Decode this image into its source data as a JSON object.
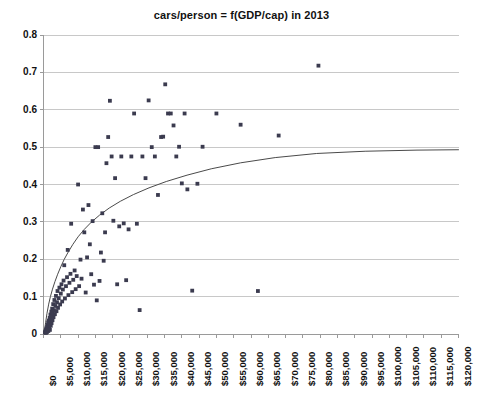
{
  "chart_data": {
    "type": "scatter",
    "title": "cars/person = f(GDP/cap) in 2013",
    "xlabel": "",
    "ylabel": "",
    "xlim": [
      0,
      120000
    ],
    "ylim": [
      0,
      0.8
    ],
    "grid": "horizontal",
    "legend": "none",
    "x_tick_step": 5000,
    "y_tick_step": 0.1,
    "x_tick_labels": [
      "$0",
      "$5,000",
      "$10,000",
      "$15,000",
      "$20,000",
      "$25,000",
      "$30,000",
      "$35,000",
      "$40,000",
      "$45,000",
      "$50,000",
      "$55,000",
      "$60,000",
      "$65,000",
      "$70,000",
      "$75,000",
      "$80,000",
      "$85,000",
      "$90,000",
      "$95,000",
      "$100,000",
      "$105,000",
      "$110,000",
      "$115,000",
      "$120,000"
    ],
    "x_tick_values": [
      0,
      5000,
      10000,
      15000,
      20000,
      25000,
      30000,
      35000,
      40000,
      45000,
      50000,
      55000,
      60000,
      65000,
      70000,
      75000,
      80000,
      85000,
      90000,
      95000,
      100000,
      105000,
      110000,
      115000,
      120000
    ],
    "y_tick_labels": [
      "0",
      "0.1",
      "0.2",
      "0.3",
      "0.4",
      "0.5",
      "0.6",
      "0.7",
      "0.8"
    ],
    "y_tick_values": [
      0,
      0.1,
      0.2,
      0.3,
      0.4,
      0.5,
      0.6,
      0.7,
      0.8
    ],
    "marker_color": "#3b3b4f",
    "trendline_color": "#4a4a4a",
    "gridline_color": "#c8c8c8",
    "axis_color": "#9a9a9a",
    "series": [
      {
        "name": "countries",
        "marker": "square",
        "points": [
          [
            400,
            0.004
          ],
          [
            520,
            0.006
          ],
          [
            600,
            0.009
          ],
          [
            700,
            0.003
          ],
          [
            760,
            0.012
          ],
          [
            820,
            0.007
          ],
          [
            900,
            0.015
          ],
          [
            980,
            0.005
          ],
          [
            1050,
            0.019
          ],
          [
            1120,
            0.01
          ],
          [
            1200,
            0.024
          ],
          [
            1260,
            0.013
          ],
          [
            1340,
            0.031
          ],
          [
            1400,
            0.008
          ],
          [
            1480,
            0.021
          ],
          [
            1550,
            0.036
          ],
          [
            1620,
            0.017
          ],
          [
            1700,
            0.027
          ],
          [
            1780,
            0.043
          ],
          [
            1850,
            0.011
          ],
          [
            1930,
            0.033
          ],
          [
            2000,
            0.052
          ],
          [
            2100,
            0.022
          ],
          [
            2180,
            0.04
          ],
          [
            2260,
            0.06
          ],
          [
            2340,
            0.029
          ],
          [
            2420,
            0.048
          ],
          [
            2500,
            0.068
          ],
          [
            2600,
            0.037
          ],
          [
            2700,
            0.056
          ],
          [
            2800,
            0.08
          ],
          [
            2900,
            0.045
          ],
          [
            3000,
            0.064
          ],
          [
            3150,
            0.091
          ],
          [
            3300,
            0.053
          ],
          [
            3450,
            0.075
          ],
          [
            3600,
            0.102
          ],
          [
            3750,
            0.061
          ],
          [
            3900,
            0.085
          ],
          [
            4050,
            0.115
          ],
          [
            4200,
            0.07
          ],
          [
            4400,
            0.096
          ],
          [
            4600,
            0.124
          ],
          [
            4800,
            0.079
          ],
          [
            5000,
            0.108
          ],
          [
            5200,
            0.133
          ],
          [
            5400,
            0.087
          ],
          [
            5600,
            0.119
          ],
          [
            5800,
            0.143
          ],
          [
            6000,
            0.184
          ],
          [
            6200,
            0.095
          ],
          [
            6500,
            0.128
          ],
          [
            6800,
            0.152
          ],
          [
            7000,
            0.225
          ],
          [
            7200,
            0.104
          ],
          [
            7500,
            0.137
          ],
          [
            7800,
            0.161
          ],
          [
            8000,
            0.295
          ],
          [
            8300,
            0.112
          ],
          [
            8600,
            0.145
          ],
          [
            9000,
            0.17
          ],
          [
            9300,
            0.12
          ],
          [
            9600,
            0.155
          ],
          [
            10000,
            0.4
          ],
          [
            10300,
            0.128
          ],
          [
            10700,
            0.199
          ],
          [
            11000,
            0.148
          ],
          [
            11400,
            0.333
          ],
          [
            11800,
            0.272
          ],
          [
            12200,
            0.111
          ],
          [
            12600,
            0.205
          ],
          [
            13000,
            0.345
          ],
          [
            13400,
            0.24
          ],
          [
            13800,
            0.16
          ],
          [
            14200,
            0.302
          ],
          [
            14600,
            0.132
          ],
          [
            15000,
            0.5
          ],
          [
            15400,
            0.09
          ],
          [
            15800,
            0.5
          ],
          [
            16200,
            0.142
          ],
          [
            16600,
            0.218
          ],
          [
            17000,
            0.323
          ],
          [
            17400,
            0.196
          ],
          [
            17800,
            0.272
          ],
          [
            18200,
            0.457
          ],
          [
            18700,
            0.527
          ],
          [
            19200,
            0.624
          ],
          [
            19700,
            0.475
          ],
          [
            20200,
            0.303
          ],
          [
            20700,
            0.417
          ],
          [
            21300,
            0.133
          ],
          [
            21900,
            0.288
          ],
          [
            22500,
            0.475
          ],
          [
            23200,
            0.296
          ],
          [
            23900,
            0.144
          ],
          [
            24600,
            0.28
          ],
          [
            25400,
            0.475
          ],
          [
            26200,
            0.59
          ],
          [
            27000,
            0.295
          ],
          [
            27800,
            0.064
          ],
          [
            28600,
            0.475
          ],
          [
            29500,
            0.417
          ],
          [
            30400,
            0.625
          ],
          [
            31300,
            0.5
          ],
          [
            32200,
            0.475
          ],
          [
            33100,
            0.372
          ],
          [
            34000,
            0.527
          ],
          [
            34600,
            0.528
          ],
          [
            35200,
            0.668
          ],
          [
            36000,
            0.59
          ],
          [
            36800,
            0.59
          ],
          [
            37600,
            0.558
          ],
          [
            38400,
            0.475
          ],
          [
            39200,
            0.501
          ],
          [
            40000,
            0.403
          ],
          [
            40800,
            0.59
          ],
          [
            41600,
            0.387
          ],
          [
            43000,
            0.116
          ],
          [
            44500,
            0.402
          ],
          [
            46000,
            0.501
          ],
          [
            50000,
            0.59
          ],
          [
            57000,
            0.56
          ],
          [
            62000,
            0.115
          ],
          [
            68000,
            0.531
          ],
          [
            79500,
            0.718
          ]
        ]
      }
    ],
    "trendline": {
      "type": "logarithmic",
      "description": "fitted saturation curve rising steeply from origin and flattening toward 0.49",
      "points": [
        [
          300,
          0.01
        ],
        [
          600,
          0.03
        ],
        [
          1000,
          0.055
        ],
        [
          1500,
          0.08
        ],
        [
          2000,
          0.1
        ],
        [
          2600,
          0.12
        ],
        [
          3300,
          0.14
        ],
        [
          4100,
          0.16
        ],
        [
          5000,
          0.18
        ],
        [
          6000,
          0.2
        ],
        [
          7200,
          0.22
        ],
        [
          8500,
          0.24
        ],
        [
          10000,
          0.26
        ],
        [
          11800,
          0.28
        ],
        [
          13800,
          0.299
        ],
        [
          16200,
          0.318
        ],
        [
          19000,
          0.337
        ],
        [
          22200,
          0.355
        ],
        [
          26000,
          0.373
        ],
        [
          30500,
          0.391
        ],
        [
          35500,
          0.408
        ],
        [
          41500,
          0.425
        ],
        [
          48500,
          0.442
        ],
        [
          57000,
          0.458
        ],
        [
          67000,
          0.472
        ],
        [
          79000,
          0.483
        ],
        [
          93000,
          0.489
        ],
        [
          108000,
          0.492
        ],
        [
          120000,
          0.493
        ]
      ]
    }
  }
}
